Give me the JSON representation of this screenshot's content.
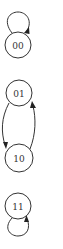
{
  "diagram": {
    "type": "state-transition-graph",
    "nodes": [
      {
        "id": "00",
        "label": "00",
        "cx": 18,
        "cy": 45
      },
      {
        "id": "01",
        "label": "01",
        "cx": 19,
        "cy": 93
      },
      {
        "id": "10",
        "label": "10",
        "cx": 19,
        "cy": 158
      },
      {
        "id": "11",
        "label": "11",
        "cx": 18,
        "cy": 206
      }
    ],
    "edges": [
      {
        "from": "00",
        "to": "00",
        "kind": "self-loop-top"
      },
      {
        "from": "01",
        "to": "10",
        "kind": "curve-left"
      },
      {
        "from": "10",
        "to": "01",
        "kind": "curve-right"
      },
      {
        "from": "11",
        "to": "11",
        "kind": "self-loop-bottom"
      }
    ],
    "colors": {
      "stroke": "#333333",
      "background": "#ffffff"
    }
  }
}
